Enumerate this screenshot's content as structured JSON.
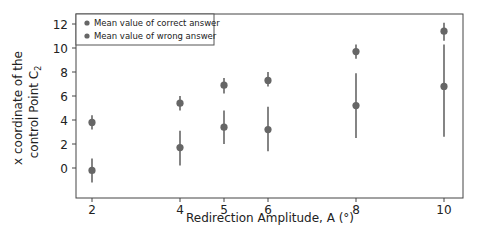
{
  "chart_data": {
    "type": "scatter",
    "title": "",
    "xlabel": "Redirection Amplitude, A (°)",
    "ylabel_line1": "x coordinate of the",
    "ylabel_line2": "control Point C",
    "ylabel_subscript": "2",
    "ylabel": "x coordinate of the control Point C2",
    "x_ticks": [
      2,
      4,
      5,
      6,
      8,
      10
    ],
    "y_ticks": [
      0,
      2,
      4,
      6,
      8,
      10,
      12
    ],
    "xlim": [
      1.6,
      10.4
    ],
    "ylim": [
      -1.6,
      12.8
    ],
    "grid": false,
    "legend_position": "upper left",
    "x": [
      2,
      4,
      5,
      6,
      8,
      10
    ],
    "series": [
      {
        "name": "Mean value of correct answer",
        "color": "#666666",
        "values": [
          3.8,
          5.4,
          6.9,
          7.3,
          9.7,
          11.4
        ],
        "err_low": [
          3.2,
          4.8,
          6.2,
          6.8,
          9.1,
          10.6
        ],
        "err_high": [
          4.4,
          6.0,
          7.5,
          8.0,
          10.3,
          12.1
        ]
      },
      {
        "name": "Mean value of wrong answer",
        "color": "#666666",
        "values": [
          -0.2,
          1.7,
          3.4,
          3.2,
          5.2,
          6.8
        ],
        "err_low": [
          -1.2,
          0.2,
          2.0,
          1.4,
          2.5,
          2.6
        ],
        "err_high": [
          0.8,
          3.1,
          4.8,
          5.1,
          7.9,
          10.3
        ]
      }
    ]
  }
}
